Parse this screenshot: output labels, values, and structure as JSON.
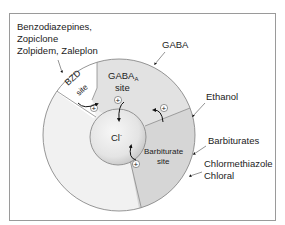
{
  "diagram": {
    "labels": {
      "bzd_drugs_line1": "Benzodiazepines,",
      "bzd_drugs_line2": "Zopiclone",
      "bzd_drugs_line3": "Zolpidem, Zaleplon",
      "gaba": "GABA",
      "ethanol": "Ethanol",
      "barbiturates": "Barbiturates",
      "chlormethiazole": "Chlormethiazole",
      "chloral": "Chloral"
    },
    "sites": {
      "bzd_line1": "BZD",
      "bzd_line2": "site",
      "gabaa_main": "GABA",
      "gabaa_sub": "A",
      "gabaa_line2": "site",
      "barb_line1": "Barbiturate",
      "barb_line2": "site"
    },
    "channel": {
      "ion": "Cl",
      "charge": "-"
    },
    "markers": {
      "plus": "+"
    },
    "colors": {
      "outer_ring": "#f1f1f1",
      "gabaa_region": "#e2e2e2",
      "barbiturate_region": "#d6d6d6",
      "bzd_region": "#ffffff",
      "channel_light": "#f4f4f4",
      "channel_dark": "#c9c9c9",
      "outline": "#8a8a8a",
      "frame": "#9a9a9a",
      "text": "#222222"
    }
  }
}
